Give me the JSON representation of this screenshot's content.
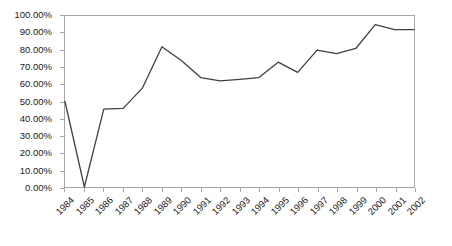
{
  "chart_data": {
    "type": "line",
    "title": "",
    "subtitle": "",
    "xlabel": "",
    "ylabel": "",
    "categories": [
      "1984",
      "1985",
      "1986",
      "1987",
      "1988",
      "1989",
      "1990",
      "1991",
      "1992",
      "1993",
      "1994",
      "1995",
      "1996",
      "1997",
      "1998",
      "1999",
      "2000",
      "2001",
      "2002"
    ],
    "values": [
      50.0,
      0.0,
      45.5,
      46.0,
      58.0,
      82.0,
      74.0,
      64.0,
      62.0,
      63.0,
      64.0,
      73.0,
      67.0,
      80.0,
      78.0,
      81.0,
      95.0,
      92.0,
      92.0
    ],
    "series": [
      {
        "name": "",
        "values": [
          50.0,
          0.0,
          45.5,
          46.0,
          58.0,
          82.0,
          74.0,
          64.0,
          62.0,
          63.0,
          64.0,
          73.0,
          67.0,
          80.0,
          78.0,
          81.0,
          95.0,
          92.0,
          92.0
        ]
      }
    ],
    "ylim": [
      0,
      100
    ],
    "y_tick_values": [
      0,
      10,
      20,
      30,
      40,
      50,
      60,
      70,
      80,
      90,
      100
    ],
    "y_tick_labels": [
      "0.00%",
      "10.00%",
      "20.00%",
      "30.00%",
      "40.00%",
      "50.00%",
      "60.00%",
      "70.00%",
      "80.00%",
      "90.00%",
      "100.00%"
    ],
    "x_tick_labels": [
      "1984",
      "1985",
      "1986",
      "1987",
      "1988",
      "1989",
      "1990",
      "1991",
      "1992",
      "1993",
      "1994",
      "1995",
      "1996",
      "1997",
      "1998",
      "1999",
      "2000",
      "2001",
      "2002"
    ],
    "grid": false,
    "legend": false,
    "legend_position": "none",
    "annotations": [],
    "colors": {
      "line": "#404040",
      "axis": "#a6a6a6",
      "text": "#1a1a1a",
      "background": "#ffffff"
    }
  }
}
